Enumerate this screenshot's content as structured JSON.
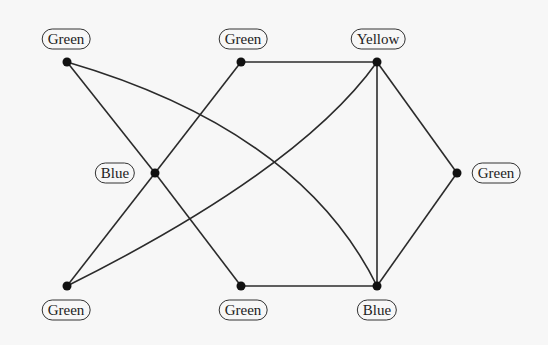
{
  "graph": {
    "nodes": [
      {
        "id": "n_tl",
        "label": "Green",
        "x": 67,
        "y": 62,
        "label_x": 66,
        "label_y": 39
      },
      {
        "id": "n_tm",
        "label": "Green",
        "x": 241,
        "y": 62,
        "label_x": 243,
        "label_y": 39
      },
      {
        "id": "n_tr",
        "label": "Yellow",
        "x": 377,
        "y": 62,
        "label_x": 378,
        "label_y": 39
      },
      {
        "id": "n_ml",
        "label": "Blue",
        "x": 155,
        "y": 173,
        "label_x": 115,
        "label_y": 173
      },
      {
        "id": "n_r",
        "label": "Green",
        "x": 457,
        "y": 173,
        "label_x": 496,
        "label_y": 173
      },
      {
        "id": "n_bl",
        "label": "Green",
        "x": 67,
        "y": 286,
        "label_x": 66,
        "label_y": 310
      },
      {
        "id": "n_bm",
        "label": "Green",
        "x": 241,
        "y": 286,
        "label_x": 243,
        "label_y": 310
      },
      {
        "id": "n_br",
        "label": "Blue",
        "x": 377,
        "y": 286,
        "label_x": 377,
        "label_y": 310
      }
    ],
    "edges": [
      {
        "from": "n_tl",
        "to": "n_ml",
        "shape": "line"
      },
      {
        "from": "n_ml",
        "to": "n_bm",
        "shape": "line"
      },
      {
        "from": "n_tm",
        "to": "n_ml",
        "shape": "line"
      },
      {
        "from": "n_ml",
        "to": "n_bl",
        "shape": "line"
      },
      {
        "from": "n_tl",
        "to": "n_br",
        "shape": "curve"
      },
      {
        "from": "n_bl",
        "to": "n_tr",
        "shape": "curve"
      },
      {
        "from": "n_tm",
        "to": "n_tr",
        "shape": "line"
      },
      {
        "from": "n_bm",
        "to": "n_br",
        "shape": "line"
      },
      {
        "from": "n_tr",
        "to": "n_br",
        "shape": "line"
      },
      {
        "from": "n_tr",
        "to": "n_r",
        "shape": "line"
      },
      {
        "from": "n_r",
        "to": "n_br",
        "shape": "line"
      }
    ]
  }
}
